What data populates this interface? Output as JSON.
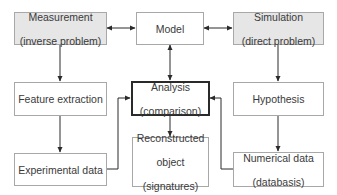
{
  "diagram": {
    "nodes": {
      "measurement": {
        "line1": "Measurement",
        "line2": "(inverse problem)",
        "fill": "#e6e6e6"
      },
      "model": {
        "line1": "Model"
      },
      "simulation": {
        "line1": "Simulation",
        "line2": "(direct problem)",
        "fill": "#e6e6e6"
      },
      "feature_extraction": {
        "line1": "Feature extraction"
      },
      "analysis": {
        "line1": "Analysis",
        "line2": "(comparison)"
      },
      "hypothesis": {
        "line1": "Hypothesis"
      },
      "experimental_data": {
        "line1": "Experimental data"
      },
      "reconstructed_object": {
        "line1": "Reconstructed",
        "line2": "object",
        "line3": "(signatures)"
      },
      "numerical_data": {
        "line1": "Numerical data",
        "line2": "(databasis)"
      }
    },
    "edges": [
      {
        "from": "measurement",
        "to": "model",
        "type": "bidirectional"
      },
      {
        "from": "model",
        "to": "simulation",
        "type": "bidirectional"
      },
      {
        "from": "model",
        "to": "analysis",
        "type": "bidirectional"
      },
      {
        "from": "measurement",
        "to": "feature_extraction",
        "type": "directed"
      },
      {
        "from": "feature_extraction",
        "to": "experimental_data",
        "type": "directed"
      },
      {
        "from": "experimental_data",
        "to": "analysis",
        "type": "directed"
      },
      {
        "from": "simulation",
        "to": "hypothesis",
        "type": "directed"
      },
      {
        "from": "hypothesis",
        "to": "numerical_data",
        "type": "directed"
      },
      {
        "from": "numerical_data",
        "to": "analysis",
        "type": "directed"
      },
      {
        "from": "analysis",
        "to": "reconstructed_object",
        "type": "directed"
      }
    ],
    "colors": {
      "line": "#2a2a2a",
      "box_border": "#a8a8a8",
      "shaded_fill": "#e6e6e6",
      "text": "#3a3a3a"
    }
  }
}
